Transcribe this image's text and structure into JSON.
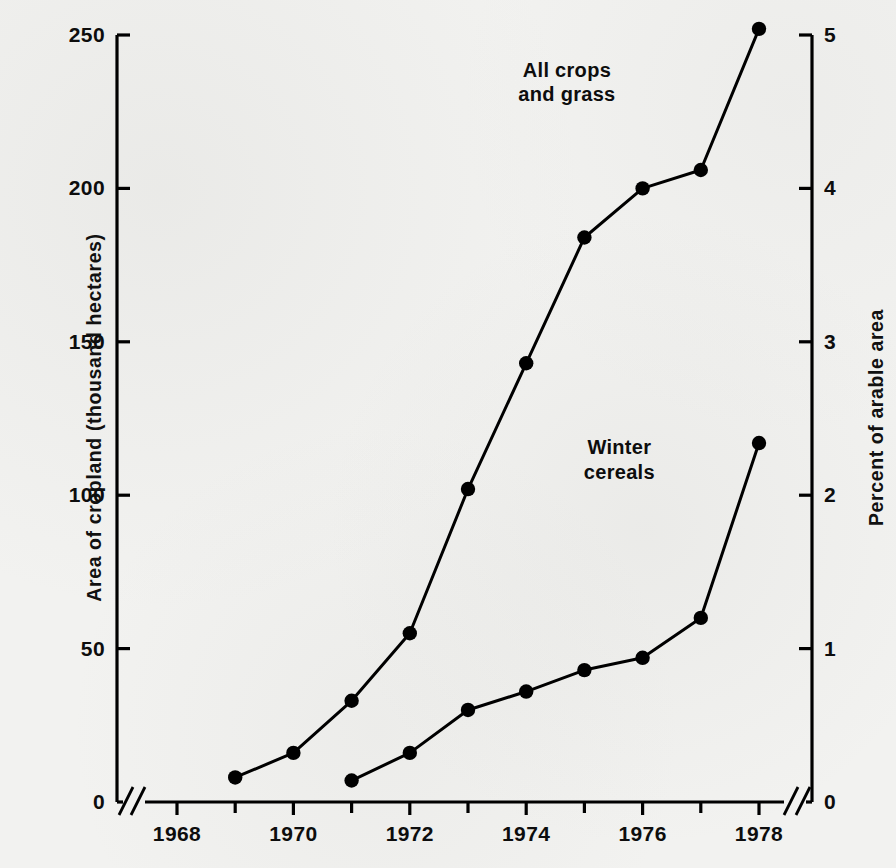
{
  "chart_data": {
    "type": "line",
    "title": "",
    "subtitle": "",
    "xlabel": "",
    "ylabel": "Area of cropland (thousand hectares)",
    "y2label": "Percent of arable area",
    "xlim": [
      1967.4,
      1978.8
    ],
    "ylim": [
      0,
      250
    ],
    "y2lim": [
      0,
      5
    ],
    "grid": false,
    "legend_position": "inline-annotation",
    "axis_breaks": [
      "x-left",
      "x-right",
      "y-left-bottom",
      "y-right-bottom"
    ],
    "x_major_ticks": [
      1968,
      1970,
      1972,
      1974,
      1976,
      1978
    ],
    "x_minor_ticks": [
      1969,
      1971,
      1973,
      1975,
      1977
    ],
    "x_tick_labels": [
      "1968",
      "1970",
      "1972",
      "1974",
      "1976",
      "1978"
    ],
    "y_ticks": [
      0,
      50,
      100,
      150,
      200,
      250
    ],
    "y_tick_labels": [
      "0",
      "50",
      "100",
      "150",
      "200",
      "250"
    ],
    "y2_ticks": [
      0,
      1,
      2,
      3,
      4,
      5
    ],
    "y2_tick_labels": [
      "0",
      "1",
      "2",
      "3",
      "4",
      "5"
    ],
    "series": [
      {
        "name": "All crops and grass",
        "label_lines": "All crops\nand grass",
        "color": "#000000",
        "marker": "circle",
        "x": [
          1969,
          1970,
          1971,
          1972,
          1973,
          1974,
          1975,
          1976,
          1977,
          1978
        ],
        "values": [
          8,
          16,
          33,
          55,
          102,
          143,
          184,
          200,
          206,
          252
        ]
      },
      {
        "name": "Winter cereals",
        "label_lines": "Winter\ncereals",
        "color": "#000000",
        "marker": "circle",
        "x": [
          1971,
          1972,
          1973,
          1974,
          1975,
          1976,
          1977,
          1978
        ],
        "values": [
          7,
          16,
          30,
          36,
          43,
          47,
          60,
          117
        ]
      }
    ],
    "annotations": [
      {
        "text": "All crops\nand grass",
        "x": 1974.7,
        "y": 238
      },
      {
        "text": "Winter cereals",
        "x": 1975.6,
        "y": 115
      }
    ]
  }
}
